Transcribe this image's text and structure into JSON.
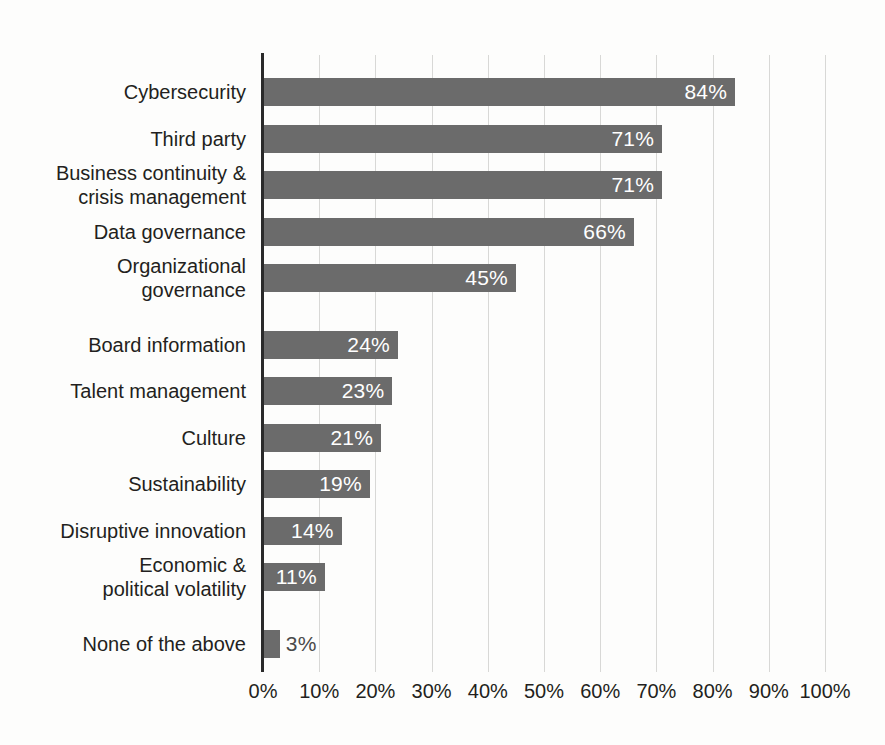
{
  "chart_data": {
    "type": "bar",
    "orientation": "horizontal",
    "title": "",
    "subtitle": "",
    "xlabel": "",
    "ylabel": "",
    "xlim": [
      0,
      100
    ],
    "xtick_labels": [
      "0%",
      "10%",
      "20%",
      "30%",
      "40%",
      "50%",
      "60%",
      "70%",
      "80%",
      "90%",
      "100%"
    ],
    "xtick_values": [
      0,
      10,
      20,
      30,
      40,
      50,
      60,
      70,
      80,
      90,
      100
    ],
    "grid": "vertical",
    "legend": "none",
    "bar_color": "#6b6b6b",
    "inside_label_color": "#ffffff",
    "outside_label_color": "#4a4a4a",
    "categories": [
      "Cybersecurity",
      "Third party",
      "Business continuity &\ncrisis management",
      "Data governance",
      "Organizational\ngovernance",
      "Board information",
      "Talent management",
      "Culture",
      "Sustainability",
      "Disruptive innovation",
      "Economic &\npolitical volatility",
      "None of the above"
    ],
    "values": [
      84,
      71,
      71,
      66,
      45,
      24,
      23,
      21,
      19,
      14,
      11,
      3
    ],
    "value_labels": [
      "84%",
      "71%",
      "71%",
      "66%",
      "45%",
      "24%",
      "23%",
      "21%",
      "19%",
      "14%",
      "11%",
      "3%"
    ],
    "label_placement": [
      "inside",
      "inside",
      "inside",
      "inside",
      "inside",
      "inside",
      "inside",
      "inside",
      "inside",
      "inside",
      "inside",
      "outside"
    ],
    "group_breaks_after": [
      4,
      10
    ]
  }
}
